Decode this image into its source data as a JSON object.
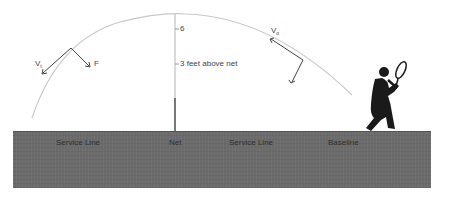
{
  "diagram": {
    "labels": {
      "height_tick_top": "6",
      "height_tick_mid": "3 feet above net",
      "velocity_left": "V",
      "velocity_left_sub": "t",
      "force_left": "F",
      "velocity_right": "V",
      "velocity_right_sub": "o"
    },
    "court": {
      "labels": [
        "Service Line",
        "Net",
        "Service Line",
        "Baseline"
      ]
    },
    "colors": {
      "court": "#6b6b6b",
      "trajectory": "#c8c8c8",
      "vectors": "#444444",
      "player": "#1a1a1a",
      "net": "#888888"
    }
  }
}
